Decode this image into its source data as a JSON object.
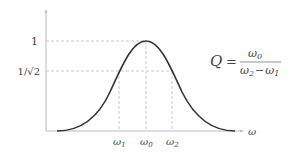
{
  "diagram": {
    "type": "resonance-curve",
    "axes": {
      "x_label": "ω",
      "y_ticks": [
        {
          "label": "1",
          "value": 1
        },
        {
          "label": "1/√2",
          "value": 0.7071
        }
      ],
      "x_ticks": [
        {
          "label": "ω",
          "sub": "1"
        },
        {
          "label": "ω",
          "sub": "0"
        },
        {
          "label": "ω",
          "sub": "2"
        }
      ]
    },
    "formula": {
      "lhs": "Q",
      "eq": "=",
      "numerator": {
        "sym": "ω",
        "sub": "0"
      },
      "denominator": {
        "a": "ω",
        "a_sub": "2",
        "op": "−",
        "b": "ω",
        "b_sub": "1"
      }
    },
    "colors": {
      "curve": "#333333",
      "axis": "#bbbbbb",
      "dashed": "#bbbbbb",
      "text": "#444444"
    }
  }
}
